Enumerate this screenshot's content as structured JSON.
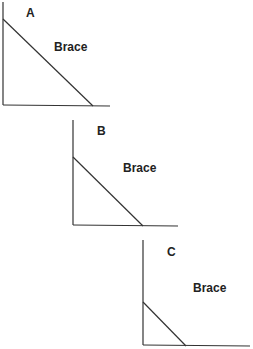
{
  "diagrams": [
    {
      "id": "A",
      "label": "A",
      "brace_label": "Brace",
      "vertical": {
        "x": 3,
        "y1": 2,
        "y2": 105
      },
      "horizontal": {
        "x1": 3,
        "y1": 105,
        "x2": 110,
        "y2": 106
      },
      "brace": {
        "x1": 3,
        "y1": 19,
        "x2": 93,
        "y2": 106
      },
      "label_pos": {
        "x": 26,
        "y": 17
      },
      "brace_label_pos": {
        "x": 54,
        "y": 51
      }
    },
    {
      "id": "B",
      "label": "B",
      "brace_label": "Brace",
      "vertical": {
        "x": 73,
        "y1": 120,
        "y2": 225
      },
      "horizontal": {
        "x1": 73,
        "y1": 225,
        "x2": 178,
        "y2": 226
      },
      "brace": {
        "x1": 73,
        "y1": 157,
        "x2": 143,
        "y2": 226
      },
      "label_pos": {
        "x": 97,
        "y": 135
      },
      "brace_label_pos": {
        "x": 123,
        "y": 172
      }
    },
    {
      "id": "C",
      "label": "C",
      "brace_label": "Brace",
      "vertical": {
        "x": 143,
        "y1": 240,
        "y2": 345
      },
      "horizontal": {
        "x1": 143,
        "y1": 345,
        "x2": 250,
        "y2": 346
      },
      "brace": {
        "x1": 143,
        "y1": 302,
        "x2": 186,
        "y2": 346
      },
      "label_pos": {
        "x": 167,
        "y": 256
      },
      "brace_label_pos": {
        "x": 193,
        "y": 292
      }
    }
  ]
}
